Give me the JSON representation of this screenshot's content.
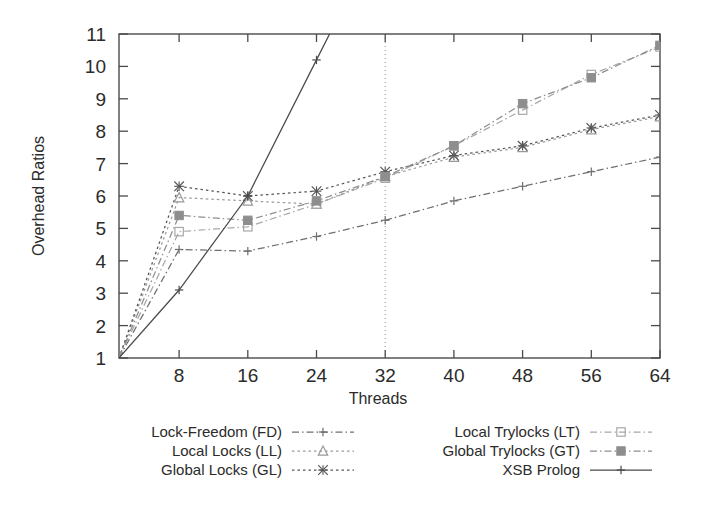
{
  "chart_data": {
    "type": "line",
    "title": "",
    "xlabel": "Threads",
    "ylabel": "Overhead Ratios",
    "xlim": [
      1,
      64
    ],
    "ylim": [
      1,
      11
    ],
    "xticks": [
      8,
      16,
      24,
      32,
      40,
      48,
      56,
      64
    ],
    "yticks": [
      1,
      2,
      3,
      4,
      5,
      6,
      7,
      8,
      9,
      10,
      11
    ],
    "grid": "vertical dotted line at x=32 only",
    "legend_position": "below plot, two columns",
    "annotations": [
      "dotted vertical reference line at 32 threads"
    ],
    "x": [
      1,
      8,
      16,
      24,
      32,
      40,
      48,
      56,
      64
    ],
    "series": [
      {
        "name": "Lock-Freedom (FD)",
        "key": "FD",
        "style": "dash-dot",
        "marker": "plus",
        "color": "#6f6f6f",
        "values": [
          1.0,
          4.35,
          4.3,
          4.75,
          5.25,
          5.85,
          6.3,
          6.75,
          7.2
        ]
      },
      {
        "name": "Local Locks (LL)",
        "key": "LL",
        "style": "dotted",
        "marker": "triangle",
        "color": "#9a9a9a",
        "values": [
          1.0,
          5.95,
          5.85,
          5.75,
          6.6,
          7.2,
          7.5,
          8.05,
          8.45
        ]
      },
      {
        "name": "Global Locks (GL)",
        "key": "GL",
        "style": "dotted",
        "marker": "star",
        "color": "#555555",
        "values": [
          1.0,
          6.3,
          6.0,
          6.15,
          6.75,
          7.25,
          7.55,
          8.1,
          8.5
        ]
      },
      {
        "name": "Local Trylocks (LT)",
        "key": "LT",
        "style": "dash-dot",
        "marker": "open-square",
        "color": "#a8a8a8",
        "values": [
          1.0,
          4.9,
          5.05,
          5.75,
          6.55,
          7.55,
          8.65,
          9.75,
          10.6
        ]
      },
      {
        "name": "Global Trylocks (GT)",
        "key": "GT",
        "style": "dash-dot",
        "marker": "filled-square",
        "color": "#8e8e8e",
        "values": [
          1.0,
          5.4,
          5.25,
          5.85,
          6.6,
          7.55,
          8.85,
          9.65,
          10.65
        ]
      },
      {
        "name": "XSB Prolog",
        "key": "XSB",
        "style": "solid",
        "marker": "plus",
        "color": "#4a4a4a",
        "values": [
          1.0,
          3.1,
          6.0,
          10.2,
          14.4,
          18.6,
          22.8,
          27.0,
          31.0
        ]
      }
    ]
  },
  "axis": {
    "ylabel": "Overhead Ratios",
    "xlabel": "Threads",
    "xtick_labels": [
      "8",
      "16",
      "24",
      "32",
      "40",
      "48",
      "56",
      "64"
    ],
    "ytick_labels": [
      "1",
      "2",
      "3",
      "4",
      "5",
      "6",
      "7",
      "8",
      "9",
      "10",
      "11"
    ]
  },
  "legend": {
    "column_left": [
      {
        "label": "Lock-Freedom (FD)",
        "key": "FD"
      },
      {
        "label": "Local Locks (LL)",
        "key": "LL"
      },
      {
        "label": "Global Locks (GL)",
        "key": "GL"
      }
    ],
    "column_right": [
      {
        "label": "Local Trylocks (LT)",
        "key": "LT"
      },
      {
        "label": "Global Trylocks (GT)",
        "key": "GT"
      },
      {
        "label": "XSB Prolog",
        "key": "XSB"
      }
    ]
  },
  "colors": {
    "axis": "#4a4a4a",
    "text": "#2b2b2b",
    "background": "#ffffff",
    "grid": "#8d8d8d"
  }
}
